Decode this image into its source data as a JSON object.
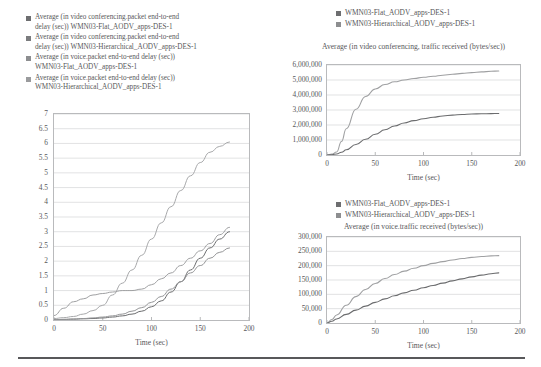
{
  "figure": {
    "background": "#ffffff",
    "text_color": "#58585a",
    "rule_color": "#58585a"
  },
  "left_legend": {
    "items": [
      {
        "marker_color": "#6d6e70",
        "label": "Average (in video conferencing.packet end-to-end\ndelay (sec)) WMN03-Flat_AODV_apps-DES-1"
      },
      {
        "marker_color": "#7b7c7e",
        "label": "Average (in video conferencing.packet end-to-end\ndelay (sec)) WMN03-Hierarchical_AODV_apps-DES-1"
      },
      {
        "marker_color": "#8d8e90",
        "label": "Average (in voice.packet end-to-end delay (sec))\nWMN03-Flat_AODV_apps-DES-1"
      },
      {
        "marker_color": "#9a9b9d",
        "label": "Average (in voice.packet end-to-end delay (sec))\nWMN03-Hierarchical_AODV_apps-DES-1"
      }
    ]
  },
  "topright_legend": {
    "items": [
      {
        "marker_color": "#6d6e70",
        "label": "WMN03-Flat_AODV_apps-DES-1"
      },
      {
        "marker_color": "#8d8e90",
        "label": "WMN03-Hierarchical_AODV_apps-DES-1"
      }
    ]
  },
  "bottomright_legend": {
    "items": [
      {
        "marker_color": "#6d6e70",
        "label": "WMN03-Flat_AODV_apps-DES-1"
      },
      {
        "marker_color": "#8d8e90",
        "label": "WMN03-Hierarchical_AODV_apps-DES-1"
      }
    ]
  },
  "chart_data": [
    {
      "id": "packet-end-to-end-delay",
      "type": "line",
      "title": "",
      "xlabel": "Time (sec)",
      "ylabel": "",
      "xlim": [
        0,
        200
      ],
      "ylim": [
        0,
        7
      ],
      "xticks": [
        0,
        50,
        100,
        150,
        200
      ],
      "yticks": [
        0,
        0.5,
        1,
        1.5,
        2,
        2.5,
        3,
        3.5,
        4,
        4.5,
        5,
        5.5,
        6,
        6.5,
        7
      ],
      "grid": true,
      "legend_position": "above-left",
      "x": [
        0,
        10,
        20,
        30,
        40,
        50,
        60,
        70,
        80,
        90,
        100,
        110,
        120,
        130,
        140,
        150,
        160,
        170,
        180
      ],
      "series": [
        {
          "name": "Average (in video conferencing.packet end-to-end delay (sec)) WMN03-Flat_AODV_apps-DES-1",
          "color": "#a8a9ab",
          "values": [
            0.05,
            0.08,
            0.12,
            0.2,
            0.32,
            0.5,
            0.85,
            1.25,
            1.7,
            2.2,
            2.75,
            3.3,
            3.85,
            4.4,
            4.9,
            5.35,
            5.7,
            5.9,
            6.05
          ]
        },
        {
          "name": "Average (in video conferencing.packet end-to-end delay (sec)) WMN03-Hierarchical_AODV_apps-DES-1",
          "color": "#9fa0a2",
          "values": [
            0.15,
            0.4,
            0.62,
            0.72,
            0.85,
            0.9,
            0.95,
            1.0,
            1.0,
            1.05,
            1.2,
            1.4,
            1.6,
            1.85,
            2.1,
            2.35,
            2.6,
            2.9,
            3.15
          ]
        },
        {
          "name": "Average (in voice.packet end-to-end delay (sec)) WMN03-Flat_AODV_apps-DES-1",
          "color": "#6b6c6e",
          "values": [
            0.01,
            0.02,
            0.03,
            0.04,
            0.05,
            0.07,
            0.1,
            0.14,
            0.2,
            0.3,
            0.45,
            0.65,
            0.95,
            1.3,
            1.7,
            2.1,
            2.45,
            2.75,
            3.0
          ]
        },
        {
          "name": "Average (in voice.packet end-to-end delay (sec)) WMN03-Hierarchical_AODV_apps-DES-1",
          "color": "#939496",
          "values": [
            0.01,
            0.02,
            0.03,
            0.05,
            0.07,
            0.1,
            0.14,
            0.2,
            0.3,
            0.42,
            0.6,
            0.8,
            1.05,
            1.3,
            1.6,
            1.85,
            2.1,
            2.3,
            2.45
          ]
        }
      ]
    },
    {
      "id": "video-conferencing-traffic-received",
      "type": "line",
      "title": "Average (in video conferencing, traffic\nreceived (bytes/sec))",
      "xlabel": "Time (sec)",
      "ylabel": "",
      "xlim": [
        0,
        200
      ],
      "ylim": [
        0,
        6000000
      ],
      "xticks": [
        0,
        50,
        100,
        150,
        200
      ],
      "yticks": [
        0,
        1000000,
        2000000,
        3000000,
        4000000,
        5000000,
        6000000
      ],
      "ytick_labels": [
        "0",
        "1,000,000",
        "2,000,000",
        "3,000,000",
        "4,000,000",
        "5,000,000",
        "6,000,000"
      ],
      "grid": true,
      "legend_position": "above",
      "x": [
        0,
        5,
        10,
        15,
        20,
        30,
        40,
        50,
        60,
        70,
        80,
        90,
        100,
        110,
        120,
        130,
        140,
        150,
        160,
        170,
        178
      ],
      "series": [
        {
          "name": "WMN03-Flat_AODV_apps-DES-1",
          "color": "#9fa0a2",
          "values": [
            0,
            60000,
            200000,
            900000,
            1750000,
            3050000,
            3900000,
            4400000,
            4700000,
            4880000,
            5000000,
            5100000,
            5180000,
            5250000,
            5320000,
            5380000,
            5440000,
            5490000,
            5540000,
            5580000,
            5600000
          ]
        },
        {
          "name": "WMN03-Hierarchical_AODV_apps-DES-1",
          "color": "#6b6c6e",
          "values": [
            0,
            20000,
            70000,
            180000,
            350000,
            700000,
            1050000,
            1380000,
            1680000,
            1930000,
            2130000,
            2290000,
            2420000,
            2520000,
            2600000,
            2660000,
            2700000,
            2730000,
            2750000,
            2760000,
            2765000
          ]
        }
      ]
    },
    {
      "id": "voice-traffic-received",
      "type": "line",
      "title": "Average (in voice.traffic received (bytes/sec))",
      "xlabel": "Time (sec)",
      "ylabel": "",
      "xlim": [
        0,
        200
      ],
      "ylim": [
        0,
        300000
      ],
      "xticks": [
        0,
        50,
        100,
        150,
        200
      ],
      "yticks": [
        0,
        50000,
        100000,
        150000,
        200000,
        250000,
        300000
      ],
      "ytick_labels": [
        "0",
        "50,000",
        "100,000",
        "150,000",
        "200,000",
        "250,000",
        "300,000"
      ],
      "grid": true,
      "legend_position": "above",
      "x": [
        0,
        5,
        10,
        20,
        30,
        40,
        50,
        60,
        70,
        80,
        90,
        100,
        110,
        120,
        130,
        140,
        150,
        160,
        170,
        178
      ],
      "series": [
        {
          "name": "WMN03-Flat_AODV_apps-DES-1",
          "color": "#9fa0a2",
          "values": [
            0,
            12000,
            28000,
            62000,
            92000,
            117000,
            138000,
            155000,
            169000,
            181000,
            191000,
            200000,
            208000,
            214000,
            220000,
            225000,
            229000,
            232000,
            234000,
            235000
          ]
        },
        {
          "name": "WMN03-Hierarchical_AODV_apps-DES-1",
          "color": "#6b6c6e",
          "values": [
            0,
            6000,
            14000,
            30000,
            45000,
            59000,
            72000,
            84000,
            95000,
            105000,
            114000,
            123000,
            131000,
            139000,
            147000,
            154000,
            161000,
            167000,
            172000,
            175000
          ]
        }
      ]
    }
  ]
}
